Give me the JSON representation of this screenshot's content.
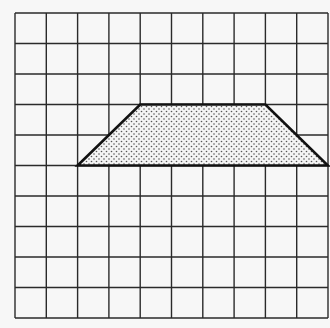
{
  "figure": {
    "type": "grid-with-trapezoid",
    "grid": {
      "columns": 10,
      "rows": 10,
      "line_color": "#2a2a2a",
      "background": "#f7f7f7"
    },
    "shape": {
      "name": "trapezoid",
      "vertices_grid_units": [
        [
          2,
          5
        ],
        [
          4,
          3
        ],
        [
          8,
          3
        ],
        [
          10,
          5
        ]
      ],
      "fill_pattern": "dots",
      "stroke_color": "#111111"
    }
  }
}
